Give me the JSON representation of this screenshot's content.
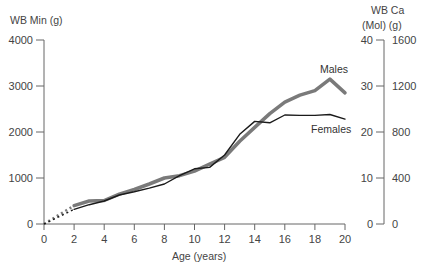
{
  "chart_data": {
    "type": "line",
    "title": "",
    "xlabel": "Age (years)",
    "ylabel": "WB Min (g)",
    "ylabel_right_1": "WB Ca",
    "ylabel_right_2": "(Mol) (g)",
    "xlim": [
      0,
      20
    ],
    "ylim": [
      0,
      4000
    ],
    "x_ticks": [
      0,
      2,
      4,
      6,
      8,
      10,
      12,
      14,
      16,
      18,
      20
    ],
    "y_ticks": [
      0,
      1000,
      2000,
      3000,
      4000
    ],
    "y_right_mol_ticks": [
      0,
      10,
      20,
      30,
      40
    ],
    "y_right_g_ticks": [
      0,
      400,
      800,
      1200,
      1600
    ],
    "grid": false,
    "legend": "inline labels",
    "x": [
      2,
      3,
      4,
      5,
      6,
      7,
      8,
      9,
      10,
      11,
      12,
      13,
      14,
      15,
      16,
      17,
      18,
      19,
      20
    ],
    "series": [
      {
        "name": "Males",
        "color": "#7a7a7a",
        "values": [
          400,
          500,
          510,
          650,
          750,
          870,
          1000,
          1050,
          1150,
          1300,
          1450,
          1800,
          2100,
          2400,
          2650,
          2800,
          2900,
          3150,
          2850
        ]
      },
      {
        "name": "Females",
        "color": "#1a1a1a",
        "values": [
          320,
          420,
          500,
          630,
          700,
          780,
          870,
          1050,
          1200,
          1230,
          1500,
          1950,
          2230,
          2200,
          2370,
          2360,
          2360,
          2380,
          2280
        ]
      }
    ],
    "extrapolation": {
      "style": "dotted",
      "from": [
        0,
        0
      ],
      "to_males": [
        2,
        400
      ],
      "to_females": [
        2,
        320
      ]
    }
  },
  "labels": {
    "males": "Males",
    "females": "Females"
  }
}
